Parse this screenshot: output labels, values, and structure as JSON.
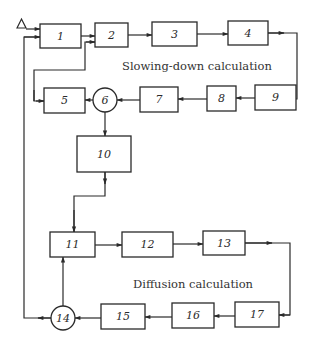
{
  "diagram": {
    "type": "flowchart",
    "sections": [
      {
        "label": "Slowing-down calculation",
        "nodes": [
          "1",
          "2",
          "3",
          "4",
          "9",
          "8",
          "7",
          "6",
          "5"
        ]
      },
      {
        "label": "Diffusion calculation",
        "nodes": [
          "11",
          "12",
          "13",
          "17",
          "16",
          "15",
          "14"
        ]
      }
    ],
    "input_symbol": "triangle",
    "nodes": [
      {
        "id": "1",
        "label": "1",
        "shape": "rect"
      },
      {
        "id": "2",
        "label": "2",
        "shape": "rect"
      },
      {
        "id": "3",
        "label": "3",
        "shape": "rect"
      },
      {
        "id": "4",
        "label": "4",
        "shape": "rect"
      },
      {
        "id": "5",
        "label": "5",
        "shape": "rect"
      },
      {
        "id": "6",
        "label": "6",
        "shape": "circle"
      },
      {
        "id": "7",
        "label": "7",
        "shape": "rect"
      },
      {
        "id": "8",
        "label": "8",
        "shape": "rect"
      },
      {
        "id": "9",
        "label": "9",
        "shape": "rect"
      },
      {
        "id": "10",
        "label": "10",
        "shape": "rect"
      },
      {
        "id": "11",
        "label": "11",
        "shape": "rect"
      },
      {
        "id": "12",
        "label": "12",
        "shape": "rect"
      },
      {
        "id": "13",
        "label": "13",
        "shape": "rect"
      },
      {
        "id": "14",
        "label": "14",
        "shape": "circle"
      },
      {
        "id": "15",
        "label": "15",
        "shape": "rect"
      },
      {
        "id": "16",
        "label": "16",
        "shape": "rect"
      },
      {
        "id": "17",
        "label": "17",
        "shape": "rect"
      }
    ],
    "edges": [
      [
        "input",
        "1"
      ],
      [
        "1",
        "2"
      ],
      [
        "2",
        "3"
      ],
      [
        "3",
        "4"
      ],
      [
        "4",
        "9"
      ],
      [
        "9",
        "8"
      ],
      [
        "8",
        "7"
      ],
      [
        "7",
        "6"
      ],
      [
        "6",
        "5"
      ],
      [
        "5",
        "2"
      ],
      [
        "6",
        "10"
      ],
      [
        "10",
        "11"
      ],
      [
        "11",
        "12"
      ],
      [
        "12",
        "13"
      ],
      [
        "13",
        "17"
      ],
      [
        "17",
        "16"
      ],
      [
        "16",
        "15"
      ],
      [
        "15",
        "14"
      ],
      [
        "14",
        "11"
      ],
      [
        "14",
        "1"
      ]
    ]
  }
}
